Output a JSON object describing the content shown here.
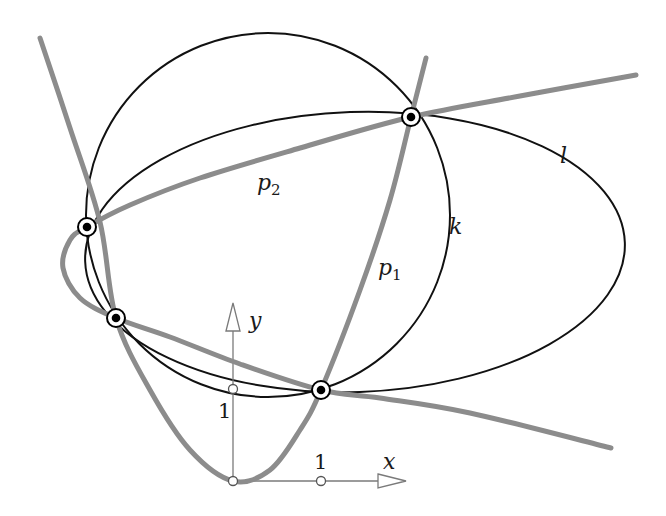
{
  "figure": {
    "labels": {
      "p1": "p",
      "p1_sub": "1",
      "p2": "p",
      "p2_sub": "2",
      "k": "k",
      "l": "l",
      "x_axis": "x",
      "y_axis": "y",
      "x_tick": "1",
      "y_tick": "1"
    },
    "colors": {
      "parabola": "#8c8c8c",
      "conic": "#111111",
      "axis": "#7a7a7a",
      "point_fill": "#ffffff",
      "point_dot": "#000000"
    }
  },
  "chart_data": {
    "type": "diagram",
    "title": "",
    "xlabel": "x",
    "ylabel": "y",
    "axis_ticks": {
      "x": [
        1
      ],
      "y": [
        1
      ]
    },
    "pixel_mapping": {
      "origin_px": [
        233,
        481
      ],
      "unit_x_px": 88,
      "unit_y_px": 91
    },
    "curves": [
      {
        "name": "p1",
        "kind": "parabola",
        "equation": "y = x^2",
        "style": "gray-thick",
        "px_points": [
          [
            40,
            38
          ],
          [
            70,
            128
          ],
          [
            100,
            222
          ],
          [
            116,
            318
          ],
          [
            150,
            390
          ],
          [
            190,
            450
          ],
          [
            233,
            481
          ],
          [
            270,
            470
          ],
          [
            300,
            430
          ],
          [
            321,
            390
          ],
          [
            360,
            290
          ],
          [
            390,
            200
          ],
          [
            411,
            117
          ],
          [
            426,
            58
          ]
        ]
      },
      {
        "name": "p2",
        "kind": "parabola (opening left)",
        "style": "gray-thick",
        "px_points": [
          [
            611,
            448
          ],
          [
            470,
            413
          ],
          [
            380,
            398
          ],
          [
            321,
            390
          ],
          [
            240,
            364
          ],
          [
            170,
            337
          ],
          [
            116,
            318
          ],
          [
            80,
            298
          ],
          [
            63,
            268
          ],
          [
            70,
            240
          ],
          [
            87,
            227
          ],
          [
            130,
            205
          ],
          [
            200,
            178
          ],
          [
            300,
            148
          ],
          [
            411,
            117
          ],
          [
            520,
            96
          ],
          [
            636,
            75
          ]
        ]
      },
      {
        "name": "k",
        "kind": "circle",
        "style": "black-thin",
        "center_px": [
          268,
          215
        ],
        "r_px": 182
      },
      {
        "name": "l",
        "kind": "ellipse",
        "style": "black-thin",
        "center_px": [
          355,
          252
        ],
        "rx_px": 270,
        "ry_px": 140,
        "rotation_deg": -2
      }
    ],
    "intersection_points_px": [
      [
        87,
        227
      ],
      [
        116,
        318
      ],
      [
        321,
        390
      ],
      [
        411,
        117
      ]
    ],
    "unit_markers_px": [
      [
        233,
        481
      ],
      [
        321,
        481
      ],
      [
        233,
        389
      ]
    ],
    "label_positions_px": {
      "p1": [
        378,
        275
      ],
      "p2": [
        257,
        190
      ],
      "k": [
        449,
        234
      ],
      "l": [
        560,
        163
      ],
      "x": [
        383,
        469
      ],
      "y": [
        249,
        328
      ],
      "x_tick": [
        314,
        469
      ],
      "y_tick": [
        218,
        418
      ]
    }
  }
}
